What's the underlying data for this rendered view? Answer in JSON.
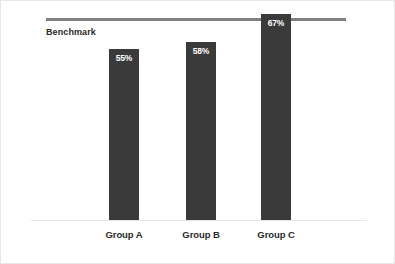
{
  "chart_data": {
    "type": "bar",
    "title": "",
    "xlabel": "",
    "ylabel": "",
    "categories": [
      "Group A",
      "Group B",
      "Group C"
    ],
    "values": [
      55,
      58,
      67
    ],
    "value_labels": [
      "55%",
      "58%",
      "67%"
    ],
    "ylim": [
      0,
      72
    ],
    "grid": false,
    "legend": "none",
    "annotations": [
      {
        "name": "benchmark",
        "label": "Benchmark",
        "value": 67,
        "type": "reference-line",
        "orientation": "horizontal",
        "note": "Group C reaches and slightly exceeds the benchmark line"
      }
    ]
  },
  "colors": {
    "bar": "#3a3a3a",
    "benchmark_line": "#808080",
    "baseline": "#e8e8e8",
    "frame_border": "#e6e6e6",
    "value_label": "#ffffff",
    "category_label": "#2b2b2b",
    "background": "#ffffff"
  }
}
